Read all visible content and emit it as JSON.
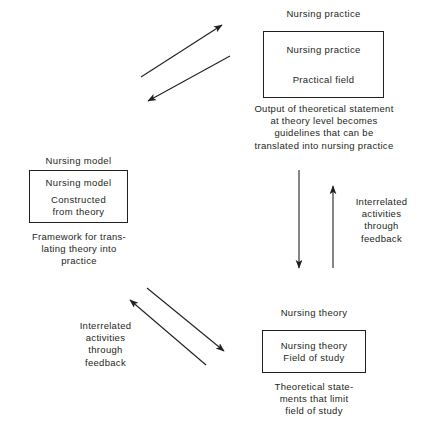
{
  "diagram": {
    "title_text": "",
    "line_color": "#231f20",
    "text_color": "#231f20",
    "background": "#ffffff",
    "nodes": {
      "nursing_practice": {
        "heading": "Nursing practice",
        "box_line_1": "Nursing practice",
        "box_line_2": "Practical field",
        "caption": "Output of theoretical statement at theory level becomes guidelines that can be translated into nursing practice"
      },
      "nursing_model": {
        "heading": "Nursing model",
        "box_line_1": "Nursing model",
        "box_line_2": "Constructed",
        "box_line_3": "from theory",
        "caption_line_1": "Framework for trans-",
        "caption_line_2": "lating theory into",
        "caption_line_3": "practice"
      },
      "nursing_theory": {
        "heading": "Nursing theory",
        "box_line_1": "Nursing theory",
        "box_line_2": "Field of study",
        "caption_line_1": "Theoretical state-",
        "caption_line_2": "ments that limit",
        "caption_line_3": "field of study"
      }
    },
    "labels": {
      "right_feedback": {
        "line_1": "Interrelated",
        "line_2": "activities",
        "line_3": "through",
        "line_4": "feedback"
      },
      "bottom_feedback": {
        "line_1": "Interrelated",
        "line_2": "activities",
        "line_3": "through",
        "line_4": "feedback"
      }
    },
    "arrows": [
      {
        "name": "diagonal-up-right-top",
        "direction": "up-right"
      },
      {
        "name": "diagonal-down-left-top",
        "direction": "down-left"
      },
      {
        "name": "vertical-down-middle",
        "direction": "down"
      },
      {
        "name": "vertical-up-middle",
        "direction": "up"
      },
      {
        "name": "diagonal-up-left-bottom",
        "direction": "up-left"
      },
      {
        "name": "diagonal-down-right-bottom",
        "direction": "down-right"
      }
    ]
  }
}
